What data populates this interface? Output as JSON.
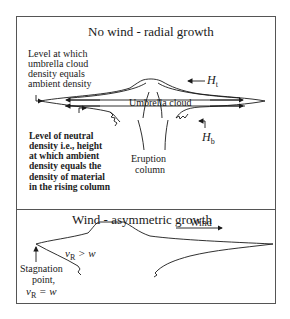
{
  "panels": {
    "top": {
      "title": "No wind - radial growth",
      "labels": {
        "level_umbrella_l1": "Level at which",
        "level_umbrella_l2": "umbrella cloud",
        "level_umbrella_l3": "density equals",
        "level_umbrella_l4": "ambient density",
        "umbrella_cloud": "Umbrella cloud",
        "h_top": "H",
        "h_top_sub": "t",
        "h_bottom": "H",
        "h_bottom_sub": "b",
        "neutral_l1": "Level of neutral",
        "neutral_l2": "density i.e., height",
        "neutral_l3": "at which ambient",
        "neutral_l4": "density equals the",
        "neutral_l5": "density of material",
        "neutral_l6": "in the rising column",
        "eruption_l1": "Eruption",
        "eruption_l2": "column"
      }
    },
    "bottom": {
      "title": "Wind - asymmetric growth",
      "labels": {
        "wind": "Wind",
        "vr_gt_w_v": "v",
        "vr_gt_w_sub": "R",
        "vr_gt_w_rest": " > w",
        "stagnation_l1": "Stagnation",
        "stagnation_l2": "point,",
        "vr_eq_w_v": "v",
        "vr_eq_w_sub": "R",
        "vr_eq_w_rest": " = w"
      }
    }
  },
  "colors": {
    "line": "#1a1a1a",
    "border": "#555555",
    "background": "#ffffff"
  }
}
